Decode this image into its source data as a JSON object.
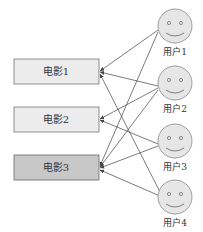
{
  "diagram": {
    "type": "bipartite-graph",
    "movies": [
      {
        "id": "m1",
        "label": "电影1",
        "fill": "#ececec"
      },
      {
        "id": "m2",
        "label": "电影2",
        "fill": "#ececec"
      },
      {
        "id": "m3",
        "label": "电影3",
        "fill": "#c8c8c8"
      }
    ],
    "users": [
      {
        "id": "u1",
        "label": "用户1"
      },
      {
        "id": "u2",
        "label": "用户2"
      },
      {
        "id": "u3",
        "label": "用户3"
      },
      {
        "id": "u4",
        "label": "用户4"
      }
    ],
    "edges": [
      {
        "from": "u1",
        "to": "m1"
      },
      {
        "from": "u1",
        "to": "m3"
      },
      {
        "from": "u2",
        "to": "m1"
      },
      {
        "from": "u2",
        "to": "m2"
      },
      {
        "from": "u2",
        "to": "m3"
      },
      {
        "from": "u3",
        "to": "m2"
      },
      {
        "from": "u3",
        "to": "m3"
      },
      {
        "from": "u4",
        "to": "m1"
      },
      {
        "from": "u4",
        "to": "m3"
      }
    ],
    "colors": {
      "edge": "#444444",
      "face_fill": "#e6e6e6",
      "face_stroke": "#888888",
      "box_stroke": "#777777"
    }
  }
}
